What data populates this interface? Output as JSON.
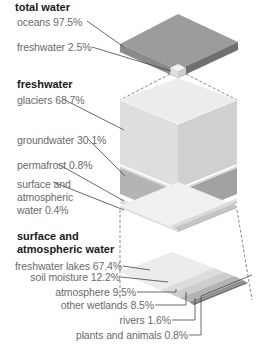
{
  "sections": {
    "total_water": {
      "heading": "total water",
      "items": [
        {
          "label": "oceans 97.5%",
          "name": "oceans",
          "value": 97.5
        },
        {
          "label": "freshwater 2.5%",
          "name": "freshwater",
          "value": 2.5
        }
      ]
    },
    "freshwater": {
      "heading": "freshwater",
      "items": [
        {
          "label": "glaciers 68.7%",
          "name": "glaciers",
          "value": 68.7
        },
        {
          "label": "groundwater 30.1%",
          "name": "groundwater",
          "value": 30.1
        },
        {
          "label": "permafrost 0.8%",
          "name": "permafrost",
          "value": 0.8
        },
        {
          "label_lines": [
            "surface and",
            "atmospheric",
            "water 0.4%"
          ],
          "name": "surface and atmospheric water",
          "value": 0.4
        }
      ]
    },
    "surface_atmospheric": {
      "heading_lines": [
        "surface and",
        "atmospheric water"
      ],
      "items": [
        {
          "label": "freshwater lakes 67.4%",
          "name": "freshwater lakes",
          "value": 67.4
        },
        {
          "label": "soil moisture 12.2%",
          "name": "soil moisture",
          "value": 12.2
        },
        {
          "label": "atmosphere 9.5%",
          "name": "atmosphere",
          "value": 9.5
        },
        {
          "label": "other wetlands 8.5%",
          "name": "other wetlands",
          "value": 8.5
        },
        {
          "label": "rivers 1.6%",
          "name": "rivers",
          "value": 1.6
        },
        {
          "label": "plants and animals 0.8%",
          "name": "plants and animals",
          "value": 0.8
        }
      ]
    }
  },
  "colors": {
    "oceans_top": "#9a9a9a",
    "oceans_side": "#7d7d7d",
    "glaciers_top": "#e6e6e6",
    "glaciers_left": "#dcdcdc",
    "glaciers_right": "#cfcfcf",
    "groundwater_left": "#b5b5b5",
    "groundwater_right": "#a3a3a3",
    "text": "#6a6a6a",
    "heading": "#1a1a1a"
  }
}
